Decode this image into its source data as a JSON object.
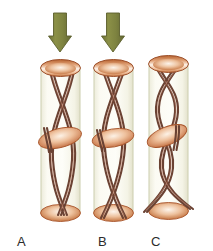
{
  "figure": {
    "name": "three-cylinders-fiber-diagram",
    "background_color": "#ffffff",
    "width": 213,
    "height": 251
  },
  "colors": {
    "arrow_fill": "#7f8440",
    "arrow_stroke": "#5e6230",
    "tube_wall": "#cfd2b4",
    "tube_fill_top": "#fbfbf0",
    "tube_fill_bottom": "#f5f3e2",
    "cap_outer": "#c06a3c",
    "cap_inner": "#fdf2e7",
    "cap_stroke": "#9c4f2a",
    "disc_outer": "#c9733f",
    "disc_inner": "#fdf0e2",
    "fiber_stroke": "#6b4233",
    "fiber_highlight": "#c2836a",
    "label_text": "#2b2b2b"
  },
  "arrows": [
    {
      "name": "arrow-panel-a",
      "label": "compression-arrow",
      "x": 60,
      "visible": true
    },
    {
      "name": "arrow-panel-b",
      "label": "compression-arrow",
      "x": 113,
      "visible": true
    }
  ],
  "panels": [
    {
      "id": "A",
      "label": "A",
      "label_x": 17,
      "label_y": 246,
      "tube_x": 41,
      "tube_width": 39,
      "tube_top": 66,
      "tube_bottom": 214,
      "has_arrow": true,
      "fiber_pattern": "crossed-x",
      "disc_y": 138,
      "disc_tilt": -14
    },
    {
      "id": "B",
      "label": "B",
      "label_x": 98,
      "label_y": 246,
      "tube_x": 94,
      "tube_width": 39,
      "tube_top": 66,
      "tube_bottom": 214,
      "has_arrow": true,
      "fiber_pattern": "lens-crossed",
      "disc_y": 138,
      "disc_tilt": -10
    },
    {
      "id": "C",
      "label": "C",
      "label_x": 151,
      "label_y": 246,
      "tube_x": 149,
      "tube_width": 39,
      "tube_top": 62,
      "tube_bottom": 212,
      "has_arrow": false,
      "fiber_pattern": "twisted-helix",
      "disc_y": 136,
      "disc_tilt": -22
    }
  ]
}
